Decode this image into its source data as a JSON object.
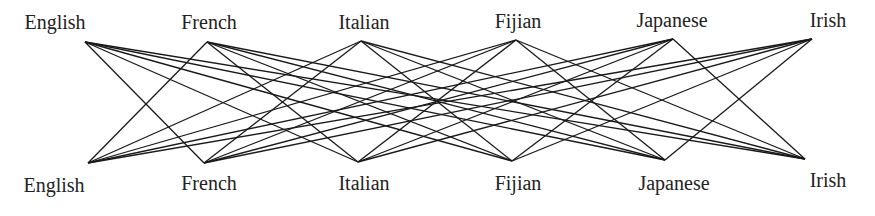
{
  "diagram": {
    "type": "bipartite-graph",
    "edge_color": "#1a1a1a",
    "top_nodes": [
      {
        "id": "english",
        "label": "English",
        "x": 85,
        "y": 42,
        "label_x": 55,
        "label_y": 12
      },
      {
        "id": "french",
        "label": "French",
        "x": 207,
        "y": 42,
        "label_x": 209,
        "label_y": 12
      },
      {
        "id": "italian",
        "label": "Italian",
        "x": 361,
        "y": 41,
        "label_x": 364,
        "label_y": 12
      },
      {
        "id": "fijian",
        "label": "Fijian",
        "x": 516,
        "y": 40,
        "label_x": 518,
        "label_y": 11
      },
      {
        "id": "japanese",
        "label": "Japanese",
        "x": 673,
        "y": 39,
        "label_x": 672,
        "label_y": 10
      },
      {
        "id": "irish",
        "label": "Irish",
        "x": 812,
        "y": 39,
        "label_x": 828,
        "label_y": 10
      }
    ],
    "bottom_nodes": [
      {
        "id": "english",
        "label": "English",
        "x": 88,
        "y": 163,
        "label_x": 54,
        "label_y": 175
      },
      {
        "id": "french",
        "label": "French",
        "x": 204,
        "y": 163,
        "label_x": 209,
        "label_y": 173
      },
      {
        "id": "italian",
        "label": "Italian",
        "x": 358,
        "y": 162,
        "label_x": 364,
        "label_y": 173
      },
      {
        "id": "fijian",
        "label": "Fijian",
        "x": 512,
        "y": 161,
        "label_x": 518,
        "label_y": 173
      },
      {
        "id": "japanese",
        "label": "Japanese",
        "x": 665,
        "y": 160,
        "label_x": 674,
        "label_y": 173
      },
      {
        "id": "irish",
        "label": "Irish",
        "x": 805,
        "y": 159,
        "label_x": 828,
        "label_y": 170
      }
    ]
  }
}
